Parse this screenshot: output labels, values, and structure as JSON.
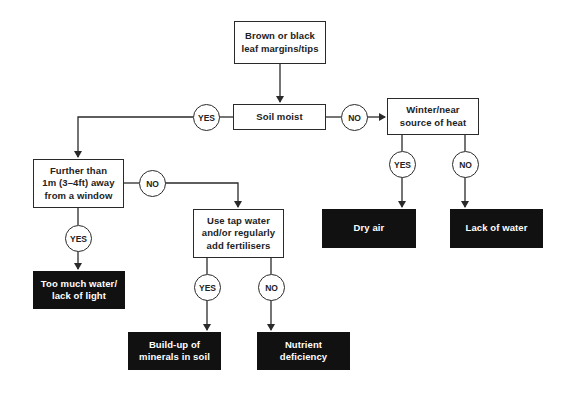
{
  "diagram": {
    "type": "flowchart",
    "title": "Brown or black leaf margins/tips",
    "colors": {
      "line": "#2a2a2a",
      "decision_fill": "#ffffff",
      "outcome_fill": "#111111",
      "outcome_text": "#ffffff"
    },
    "nodes": {
      "start": {
        "text": "Brown or black\nleaf margins/tips",
        "kind": "decision"
      },
      "soil_moist": {
        "text": "Soil moist",
        "kind": "decision"
      },
      "winter": {
        "text": "Winter/near\nsource of heat",
        "kind": "decision"
      },
      "further": {
        "text": "Further than\n1m (3–4ft) away\nfrom a window",
        "kind": "decision"
      },
      "tap_water": {
        "text": "Use tap water\nand/or regularly\nadd fertilisers",
        "kind": "decision"
      },
      "dry_air": {
        "text": "Dry air",
        "kind": "outcome"
      },
      "lack_water": {
        "text": "Lack of water",
        "kind": "outcome"
      },
      "too_much_water": {
        "text": "Too much water/\nlack of light",
        "kind": "outcome"
      },
      "build_up": {
        "text": "Build-up of\nminerals in soil",
        "kind": "outcome"
      },
      "nutrient": {
        "text": "Nutrient\ndeficiency",
        "kind": "outcome"
      }
    },
    "labels": {
      "soil_yes": "YES",
      "soil_no": "NO",
      "winter_yes": "YES",
      "winter_no": "NO",
      "further_yes": "YES",
      "further_no": "NO",
      "tap_yes": "YES",
      "tap_no": "NO"
    },
    "edges": [
      {
        "from": "start",
        "to": "soil_moist",
        "label": ""
      },
      {
        "from": "soil_moist",
        "to": "further",
        "label": "YES"
      },
      {
        "from": "soil_moist",
        "to": "winter",
        "label": "NO"
      },
      {
        "from": "winter",
        "to": "dry_air",
        "label": "YES"
      },
      {
        "from": "winter",
        "to": "lack_water",
        "label": "NO"
      },
      {
        "from": "further",
        "to": "too_much_water",
        "label": "YES"
      },
      {
        "from": "further",
        "to": "tap_water",
        "label": "NO"
      },
      {
        "from": "tap_water",
        "to": "build_up",
        "label": "YES"
      },
      {
        "from": "tap_water",
        "to": "nutrient",
        "label": "NO"
      }
    ]
  }
}
